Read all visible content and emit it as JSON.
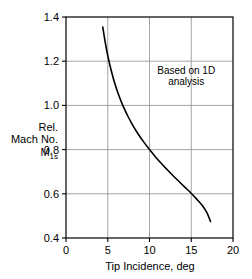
{
  "chart_data": {
    "type": "line",
    "title": "",
    "subtitle": "",
    "xlabel": "Tip Incidence, deg",
    "ylabel_lines": [
      "Rel.",
      "Mach No.",
      "M"
    ],
    "ylabel_subscript": "1s",
    "ylabel_full": "Rel. Mach No. M1s",
    "xlim": [
      0,
      20
    ],
    "ylim": [
      0.4,
      1.4
    ],
    "xticks": [
      0,
      5,
      10,
      15,
      20
    ],
    "yticks": [
      0.4,
      0.6,
      0.8,
      1.0,
      1.2,
      1.4
    ],
    "xtick_labels": [
      "0",
      "5",
      "10",
      "15",
      "20"
    ],
    "ytick_labels": [
      "0.4",
      "0.6",
      "0.8",
      "1.0",
      "1.2",
      "1.4"
    ],
    "grid": true,
    "grid_color": "#9a9a9a",
    "axis_color": "#000000",
    "legend": null,
    "legend_position": "none",
    "annotations": [
      {
        "name": "based-on-1d-analysis",
        "lines": [
          "Based on 1D",
          "analysis"
        ],
        "x": 14.4,
        "y": 1.14
      }
    ],
    "series": [
      {
        "name": "rel-mach-vs-tip-incidence",
        "color": "#000000",
        "line_width": 1.6,
        "x": [
          4.4,
          4.7,
          5.0,
          5.4,
          5.8,
          6.3,
          6.8,
          7.4,
          8.0,
          8.6,
          9.3,
          10.0,
          10.7,
          11.4,
          12.1,
          12.8,
          13.5,
          14.2,
          14.9,
          15.6,
          16.3,
          16.9,
          17.3
        ],
        "y": [
          1.355,
          1.285,
          1.225,
          1.16,
          1.105,
          1.048,
          1.0,
          0.952,
          0.91,
          0.873,
          0.835,
          0.8,
          0.768,
          0.738,
          0.71,
          0.683,
          0.657,
          0.631,
          0.606,
          0.578,
          0.548,
          0.513,
          0.475
        ]
      }
    ]
  },
  "geometry": {
    "plot_left": 66,
    "plot_right": 233,
    "plot_top": 17,
    "plot_bottom": 238
  }
}
